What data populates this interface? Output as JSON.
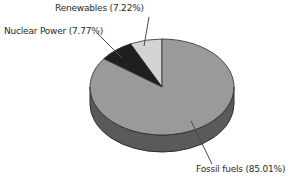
{
  "chart_data": {
    "type": "pie",
    "style": "3d",
    "title": "",
    "legend": "none",
    "labels_style": "callout-lines",
    "start_angle_deg": 90,
    "direction": "counterclockwise",
    "slices": [
      {
        "name": "Renewables",
        "value": 7.22,
        "label": "Renewables (7.22%)",
        "color": "#d4d4d4"
      },
      {
        "name": "Nuclear Power",
        "value": 7.77,
        "label": "Nuclear Power (7.77%)",
        "color": "#1f1f1f"
      },
      {
        "name": "Fossil fuels",
        "value": 85.01,
        "label": "Fossil fuels (85.01%)",
        "color": "#9a9a9a"
      }
    ],
    "side_color": "#5a5a5a",
    "outline_color": "#2b2b2b",
    "leader_line_color": "#4a4a4a",
    "background": "#ffffff",
    "text_color": "#2a2a2a"
  }
}
